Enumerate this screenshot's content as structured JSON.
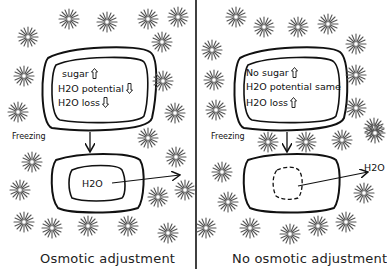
{
  "panels": {
    "left": {
      "caption": "Osmotic adjustment",
      "before_cell": {
        "lines": [
          {
            "text": "sugar",
            "arrow": "up"
          },
          {
            "text": "H2O potential",
            "arrow": "down"
          },
          {
            "text": "H2O loss",
            "arrow": "down"
          }
        ]
      },
      "process_label": "Freezing",
      "after_cell": {
        "inner_label": "H2O",
        "protoplast": "solid"
      },
      "outflow_label": ""
    },
    "right": {
      "caption": "No osmotic adjustment",
      "before_cell": {
        "lines": [
          {
            "text": "No sugar",
            "arrow": "up"
          },
          {
            "text": "H2O potential same",
            "arrow": "none"
          },
          {
            "text": "H2O loss",
            "arrow": "up"
          }
        ]
      },
      "process_label": "Freezing",
      "after_cell": {
        "inner_label": "",
        "protoplast": "dashed-collapsed"
      },
      "outflow_label": "H2O"
    }
  },
  "decorations": {
    "ice_crystal_icon": "eight-point-star",
    "divider": "vertical-line",
    "stroke_color": "#111111"
  }
}
